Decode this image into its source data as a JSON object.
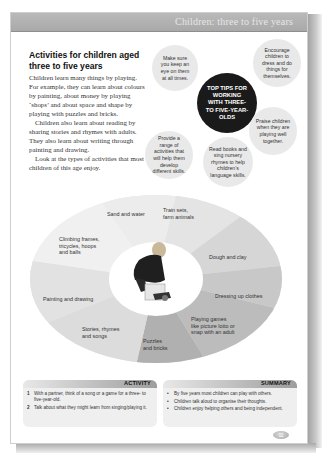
{
  "header": {
    "title": "Children: three to five years"
  },
  "section": {
    "heading": "Activities for children aged three to five years",
    "paragraphs": [
      "Children learn many things by playing. For example, they can learn about colours by painting, about money by playing ‘shops’ and about space and shape by playing with puzzles and bricks.",
      "Children also learn about reading by sharing stories and rhymes with adults. They also learn about writing through painting and drawing.",
      "Look at the types of activities that most children of this age enjoy."
    ]
  },
  "tips": {
    "center": "TOP TIPS FOR WORKING WITH THREE- TO FIVE-YEAR-OLDS",
    "items": [
      "Make sure you keep an eye on them at all times.",
      "Encourage children to dress and do things for themselves.",
      "Praise children when they are playing well together.",
      "Read books and sing nursery rhymes to help children’s language skills.",
      "Provide a range of activities that will help them develop different skills."
    ]
  },
  "activity_wheel": {
    "center_image": "child-playing-photo",
    "segments": [
      {
        "label": "Sand and water",
        "color": "#ececec"
      },
      {
        "label": "Train sets, farm animals",
        "color": "#e4e4e4"
      },
      {
        "label": "Dough and clay",
        "color": "#d6d6d6"
      },
      {
        "label": "Dressing up clothes",
        "color": "#c8c8c8"
      },
      {
        "label": "Playing games like picture lotto or snap with an adult",
        "color": "#bcbcbc"
      },
      {
        "label": "Puzzles and bricks",
        "color": "#b0b0b0"
      },
      {
        "label": "Stories, rhymes and songs",
        "color": "#dcdcdc"
      },
      {
        "label": "Painting and drawing",
        "color": "#e2e2e2"
      },
      {
        "label": "Climbing frames, tricycles, hoops and balls",
        "color": "#f0f0f0"
      }
    ]
  },
  "activity_box": {
    "title": "ACTIVITY",
    "items": [
      {
        "num": "1",
        "text": "With a partner, think of a song or a game for a three- to five-year-old."
      },
      {
        "num": "2",
        "text": "Talk about what they might learn from singing/playing it."
      }
    ]
  },
  "summary_box": {
    "title": "SUMMARY",
    "items": [
      "By five years most children can play with others.",
      "Children talk aloud to organise their thoughts.",
      "Children enjoy helping others and being independent."
    ]
  },
  "footer": {
    "page_number": "11"
  }
}
